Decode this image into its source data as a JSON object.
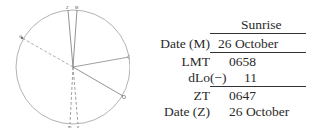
{
  "diagram": {
    "type": "time-diagram",
    "labels": {
      "top_left": "Z",
      "top_right": "M",
      "left": "G",
      "right_lower": "⊙",
      "bottom_left": "m",
      "bottom_right": "z"
    },
    "colors": {
      "circle": "#9a9a9a",
      "line": "#777777"
    }
  },
  "table": {
    "header": "Sunrise",
    "rows": [
      {
        "label": "Date (M)",
        "value": "26 October"
      },
      {
        "label": "LMT",
        "value": "0658"
      },
      {
        "label": "dLo",
        "sign": "(−)",
        "value": "11"
      },
      {
        "label": "ZT",
        "value": "0647"
      },
      {
        "label": "Date (Z)",
        "value": "26 October"
      }
    ]
  }
}
